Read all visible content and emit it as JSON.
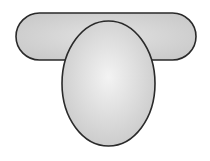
{
  "diagram": {
    "background": "#ffffff",
    "stroke": "#2a2a2a",
    "fill_center": "#f2f2f2",
    "fill_edge": "#c8c8c8",
    "shapes": [
      {
        "kind": "stadium",
        "x": 16,
        "y": 13,
        "width": 180,
        "height": 47
      },
      {
        "kind": "ellipse",
        "cx": 108.5,
        "cy": 83.5,
        "rx": 46.5,
        "ry": 62.5
      }
    ]
  }
}
